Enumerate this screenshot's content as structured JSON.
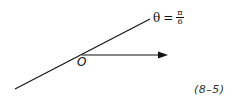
{
  "diagram": {
    "line_label": {
      "variable": "θ",
      "equals": "=",
      "numerator": "π",
      "denominator": "6"
    },
    "origin_label": "O",
    "caption": "(8–5)",
    "colors": {
      "ink": "#111111",
      "background": "#ffffff"
    }
  }
}
